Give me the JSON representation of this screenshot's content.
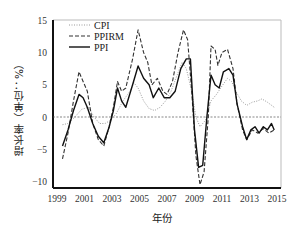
{
  "chart_data": {
    "type": "line",
    "title": "",
    "xlabel": "年份",
    "ylabel": "增长率（单位：%）",
    "xlim": [
      1999,
      2015
    ],
    "ylim": [
      -12,
      15
    ],
    "x_ticks": [
      "1999",
      "2001",
      "2003",
      "2005",
      "2007",
      "2009",
      "2011",
      "2013",
      "2015"
    ],
    "y_ticks": [
      "15",
      "10",
      "5",
      "0",
      "-5",
      "-10"
    ],
    "grid": false,
    "zero_line": true,
    "legend_position": "upper-left",
    "series": [
      {
        "name": "CPI",
        "style": "dotted",
        "color": "#9a9a9a",
        "points": [
          [
            1999.4,
            -1.2
          ],
          [
            1999.8,
            -1.0
          ],
          [
            2000.3,
            0.0
          ],
          [
            2000.8,
            1.2
          ],
          [
            2001.3,
            1.5
          ],
          [
            2001.7,
            0.0
          ],
          [
            2002.1,
            -1.0
          ],
          [
            2002.5,
            -1.0
          ],
          [
            2002.9,
            -0.5
          ],
          [
            2003.3,
            0.5
          ],
          [
            2003.8,
            2.5
          ],
          [
            2004.3,
            4.0
          ],
          [
            2004.6,
            5.3
          ],
          [
            2004.9,
            4.5
          ],
          [
            2005.3,
            2.5
          ],
          [
            2005.7,
            1.3
          ],
          [
            2006.1,
            1.0
          ],
          [
            2006.5,
            1.5
          ],
          [
            2006.9,
            2.5
          ],
          [
            2007.3,
            4.0
          ],
          [
            2007.7,
            6.3
          ],
          [
            2008.1,
            8.5
          ],
          [
            2008.4,
            7.5
          ],
          [
            2008.8,
            4.0
          ],
          [
            2009.1,
            0.0
          ],
          [
            2009.4,
            -1.5
          ],
          [
            2009.8,
            -0.5
          ],
          [
            2010.2,
            2.5
          ],
          [
            2010.6,
            3.5
          ],
          [
            2011.0,
            4.8
          ],
          [
            2011.4,
            6.0
          ],
          [
            2011.7,
            5.5
          ],
          [
            2012.0,
            4.0
          ],
          [
            2012.4,
            2.5
          ],
          [
            2012.8,
            1.8
          ],
          [
            2013.2,
            2.3
          ],
          [
            2013.6,
            2.5
          ],
          [
            2013.9,
            2.8
          ],
          [
            2014.3,
            2.3
          ],
          [
            2014.8,
            1.5
          ]
        ]
      },
      {
        "name": "PPIRM",
        "style": "dashed",
        "color": "#333333",
        "points": [
          [
            1999.4,
            -6.5
          ],
          [
            1999.8,
            -2.5
          ],
          [
            2000.2,
            2.5
          ],
          [
            2000.6,
            7.0
          ],
          [
            2000.9,
            5.5
          ],
          [
            2001.2,
            4.0
          ],
          [
            2001.6,
            -1.0
          ],
          [
            2002.0,
            -3.5
          ],
          [
            2002.4,
            -4.5
          ],
          [
            2002.8,
            -1.5
          ],
          [
            2003.1,
            1.5
          ],
          [
            2003.4,
            5.5
          ],
          [
            2003.7,
            4.0
          ],
          [
            2004.0,
            4.5
          ],
          [
            2004.5,
            9.0
          ],
          [
            2004.9,
            13.5
          ],
          [
            2005.3,
            10.0
          ],
          [
            2005.6,
            8.5
          ],
          [
            2005.9,
            5.0
          ],
          [
            2006.3,
            6.0
          ],
          [
            2006.7,
            4.0
          ],
          [
            2007.0,
            3.5
          ],
          [
            2007.4,
            5.5
          ],
          [
            2007.8,
            10.0
          ],
          [
            2008.2,
            13.5
          ],
          [
            2008.5,
            12.0
          ],
          [
            2008.8,
            4.0
          ],
          [
            2009.1,
            -6.0
          ],
          [
            2009.4,
            -10.5
          ],
          [
            2009.7,
            -8.5
          ],
          [
            2010.0,
            0.0
          ],
          [
            2010.2,
            11.0
          ],
          [
            2010.5,
            10.5
          ],
          [
            2010.7,
            8.0
          ],
          [
            2011.0,
            10.0
          ],
          [
            2011.4,
            10.5
          ],
          [
            2011.8,
            7.5
          ],
          [
            2012.1,
            2.0
          ],
          [
            2012.5,
            -2.0
          ],
          [
            2012.8,
            -3.5
          ],
          [
            2013.2,
            -2.0
          ],
          [
            2013.6,
            -2.5
          ],
          [
            2014.0,
            -1.8
          ],
          [
            2014.4,
            -2.5
          ],
          [
            2014.8,
            -2.0
          ]
        ]
      },
      {
        "name": "PPI",
        "style": "solid",
        "color": "#111111",
        "points": [
          [
            1999.4,
            -4.5
          ],
          [
            1999.8,
            -2.0
          ],
          [
            2000.2,
            1.0
          ],
          [
            2000.6,
            3.5
          ],
          [
            2000.9,
            3.0
          ],
          [
            2001.2,
            1.5
          ],
          [
            2001.6,
            -1.0
          ],
          [
            2002.0,
            -3.0
          ],
          [
            2002.4,
            -4.0
          ],
          [
            2002.8,
            -1.5
          ],
          [
            2003.1,
            1.0
          ],
          [
            2003.4,
            4.5
          ],
          [
            2003.7,
            2.5
          ],
          [
            2004.0,
            1.5
          ],
          [
            2004.5,
            5.0
          ],
          [
            2004.9,
            7.9
          ],
          [
            2005.3,
            6.0
          ],
          [
            2005.7,
            5.0
          ],
          [
            2006.0,
            3.0
          ],
          [
            2006.4,
            4.5
          ],
          [
            2006.8,
            3.0
          ],
          [
            2007.2,
            3.0
          ],
          [
            2007.6,
            4.0
          ],
          [
            2008.0,
            7.5
          ],
          [
            2008.4,
            9.0
          ],
          [
            2008.7,
            9.0
          ],
          [
            2009.0,
            -2.0
          ],
          [
            2009.3,
            -7.8
          ],
          [
            2009.6,
            -7.5
          ],
          [
            2009.9,
            0.0
          ],
          [
            2010.2,
            6.5
          ],
          [
            2010.5,
            5.0
          ],
          [
            2010.8,
            4.5
          ],
          [
            2011.1,
            7.0
          ],
          [
            2011.5,
            7.5
          ],
          [
            2011.8,
            6.5
          ],
          [
            2012.1,
            2.0
          ],
          [
            2012.5,
            -1.5
          ],
          [
            2012.8,
            -3.5
          ],
          [
            2013.1,
            -2.0
          ],
          [
            2013.4,
            -1.5
          ],
          [
            2013.7,
            -2.5
          ],
          [
            2014.0,
            -1.5
          ],
          [
            2014.3,
            -2.0
          ],
          [
            2014.6,
            -1.0
          ],
          [
            2014.8,
            -2.0
          ]
        ]
      }
    ]
  }
}
